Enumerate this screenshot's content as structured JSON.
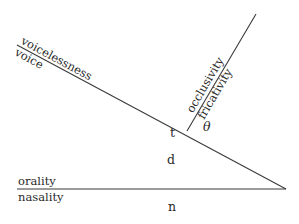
{
  "diagram": {
    "title": "",
    "feature_axes": [
      {
        "id": "voicing",
        "label_above": "voicelessness",
        "label_below": "voice"
      },
      {
        "id": "manner",
        "label_above": "occlusivity",
        "label_below": "fricativity"
      },
      {
        "id": "nasality",
        "label_above": "orality",
        "label_below": "nasality"
      }
    ],
    "regions": {
      "t": "t",
      "theta": "θ",
      "d": "d",
      "n": "n"
    }
  }
}
